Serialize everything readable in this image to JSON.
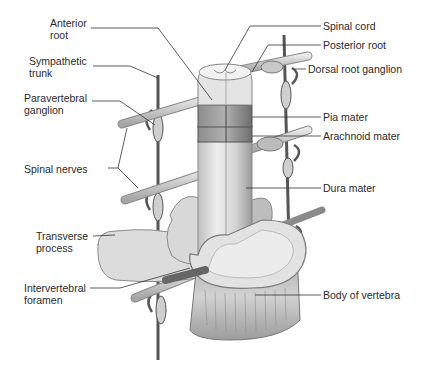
{
  "diagram": {
    "labels_left": [
      {
        "id": "anterior-root",
        "text": "Anterior\nroot",
        "x": 50,
        "y": 22
      },
      {
        "id": "sympathetic-trunk",
        "text": "Sympathetic\ntrunk",
        "x": 29,
        "y": 60
      },
      {
        "id": "paravertebral-ganglion",
        "text": "Paravertebral\nganglion",
        "x": 24,
        "y": 97
      },
      {
        "id": "spinal-nerves",
        "text": "Spinal nerves",
        "x": 24,
        "y": 163
      },
      {
        "id": "transverse-process",
        "text": "Transverse\nprocess",
        "x": 36,
        "y": 231
      },
      {
        "id": "intervertebral-foramen",
        "text": "Intervertebral\nforamen",
        "x": 24,
        "y": 283
      }
    ],
    "labels_right": [
      {
        "id": "spinal-cord",
        "text": "Spinal cord",
        "x": 323,
        "y": 20
      },
      {
        "id": "posterior-root",
        "text": "Posterior root",
        "x": 323,
        "y": 39
      },
      {
        "id": "dorsal-root-ganglion",
        "text": "Dorsal root ganglion",
        "x": 308,
        "y": 63
      },
      {
        "id": "pia-mater",
        "text": "Pia mater",
        "x": 323,
        "y": 111
      },
      {
        "id": "arachnoid-mater",
        "text": "Arachnoid mater",
        "x": 323,
        "y": 130
      },
      {
        "id": "dura-mater",
        "text": "Dura mater",
        "x": 323,
        "y": 182
      },
      {
        "id": "body-of-vertebra",
        "text": "Body of vertebra",
        "x": 323,
        "y": 289
      }
    ],
    "colors": {
      "text": "#2a2a2a",
      "leader_line": "#333333",
      "bone_light": "#e6e6e6",
      "bone_mid": "#bdbdbd",
      "bone_dark": "#8a8a8a",
      "cord_band": "#7a7a7a"
    }
  }
}
